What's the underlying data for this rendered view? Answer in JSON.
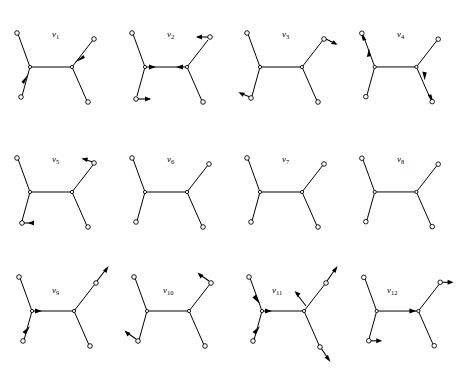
{
  "figure": {
    "background_color": "#ffffff",
    "stroke_color": "#000000",
    "node_fill": "#ffffff",
    "rows": 3,
    "cols": 4,
    "count": 12
  },
  "trees": [
    {
      "id": "v1",
      "label": "v",
      "subscript": "1",
      "label_x": 52,
      "label_y": 30,
      "cell_x": 0,
      "cell_y": 0,
      "arrows": [
        {
          "branch": "lower-left",
          "direction": "inward",
          "toward": "internal-node-left"
        },
        {
          "branch": "upper-right",
          "direction": "inward",
          "toward": "internal-node-right"
        }
      ],
      "arrow_count": 2
    },
    {
      "id": "v2",
      "label": "v",
      "subscript": "2",
      "label_x": 52,
      "label_y": 30,
      "cell_x": 115,
      "cell_y": 0,
      "arrows": [
        {
          "branch": "upper-right",
          "direction": "left",
          "toward": "internal-node-right"
        },
        {
          "branch": "lower-left",
          "direction": "right",
          "toward": "away"
        },
        {
          "branch": "internal-left",
          "direction": "right",
          "toward": "internal-node-right"
        },
        {
          "branch": "internal-right",
          "direction": "left",
          "toward": "internal-node-left"
        }
      ],
      "arrow_count": 4
    },
    {
      "id": "v3",
      "label": "v",
      "subscript": "3",
      "label_x": 52,
      "label_y": 30,
      "cell_x": 230,
      "cell_y": 0,
      "arrows": [
        {
          "branch": "upper-right",
          "direction": "outward",
          "toward": "away"
        },
        {
          "branch": "lower-left",
          "direction": "outward",
          "toward": "away"
        }
      ],
      "arrow_count": 2
    },
    {
      "id": "v4",
      "label": "v",
      "subscript": "4",
      "label_x": 52,
      "label_y": 30,
      "cell_x": 345,
      "cell_y": 0,
      "arrows": [
        {
          "branch": "upper-left",
          "direction": "down-left",
          "toward": "away"
        },
        {
          "branch": "upper-left-mid",
          "direction": "up",
          "toward": "leaf"
        },
        {
          "branch": "lower-right",
          "direction": "down",
          "toward": "away"
        },
        {
          "branch": "lower-right-end",
          "direction": "down-right",
          "toward": "away"
        }
      ],
      "arrow_count": 4
    },
    {
      "id": "v5",
      "label": "v",
      "subscript": "5",
      "label_x": 52,
      "label_y": 30,
      "cell_x": 0,
      "cell_y": 125,
      "arrows": [
        {
          "branch": "upper-right",
          "direction": "up-right",
          "toward": "away"
        },
        {
          "branch": "lower-left",
          "direction": "left",
          "toward": "away"
        }
      ],
      "arrow_count": 2
    },
    {
      "id": "v6",
      "label": "v",
      "subscript": "6",
      "label_x": 52,
      "label_y": 30,
      "cell_x": 115,
      "cell_y": 125,
      "arrows": [],
      "arrow_count": 0
    },
    {
      "id": "v7",
      "label": "v",
      "subscript": "7",
      "label_x": 52,
      "label_y": 30,
      "cell_x": 230,
      "cell_y": 125,
      "arrows": [],
      "arrow_count": 0
    },
    {
      "id": "v8",
      "label": "v",
      "subscript": "8",
      "label_x": 52,
      "label_y": 30,
      "cell_x": 345,
      "cell_y": 125,
      "arrows": [],
      "arrow_count": 0
    },
    {
      "id": "v9",
      "label": "v",
      "subscript": "9",
      "label_x": 52,
      "label_y": 38,
      "cell_x": 0,
      "cell_y": 256,
      "arrows": [
        {
          "branch": "upper-right",
          "direction": "up-right",
          "toward": "away"
        },
        {
          "branch": "lower-left",
          "direction": "up-right",
          "toward": "internal-node-left"
        },
        {
          "branch": "internal-left",
          "direction": "right",
          "toward": "internal-node-right"
        }
      ],
      "arrow_count": 3
    },
    {
      "id": "v10",
      "label": "v",
      "subscript": "10",
      "label_x": 48,
      "label_y": 38,
      "cell_x": 115,
      "cell_y": 256,
      "arrows": [
        {
          "branch": "upper-right",
          "direction": "up-left",
          "toward": "away"
        },
        {
          "branch": "lower-left",
          "direction": "up-left",
          "toward": "away"
        }
      ],
      "arrow_count": 2
    },
    {
      "id": "v11",
      "label": "v",
      "subscript": "11",
      "label_x": 48,
      "label_y": 38,
      "cell_x": 230,
      "cell_y": 256,
      "arrows": [
        {
          "branch": "upper-left",
          "direction": "down-right",
          "toward": "internal-node-left"
        },
        {
          "branch": "upper-right",
          "direction": "up-right",
          "toward": "away"
        },
        {
          "branch": "upper-right-inner",
          "direction": "up-left",
          "toward": "away"
        },
        {
          "branch": "lower-left",
          "direction": "up-right",
          "toward": "internal-node-left"
        },
        {
          "branch": "lower-right",
          "direction": "down-right",
          "toward": "away"
        },
        {
          "branch": "internal-left",
          "direction": "right",
          "toward": "internal-node-right"
        }
      ],
      "arrow_count": 6
    },
    {
      "id": "v12",
      "label": "v",
      "subscript": "12",
      "label_x": 48,
      "label_y": 38,
      "cell_x": 345,
      "cell_y": 256,
      "arrows": [
        {
          "branch": "upper-right",
          "direction": "right",
          "toward": "away"
        },
        {
          "branch": "lower-left",
          "direction": "right",
          "toward": "away"
        },
        {
          "branch": "internal-right",
          "direction": "right",
          "toward": "internal-node-right"
        }
      ],
      "arrow_count": 3
    }
  ]
}
